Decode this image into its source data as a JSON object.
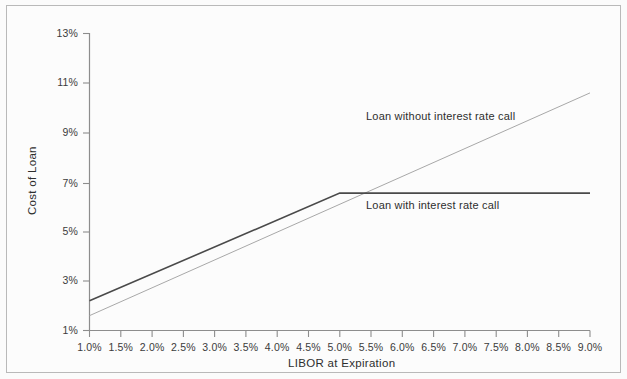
{
  "chart_data": {
    "type": "line",
    "title": "",
    "xlabel": "LIBOR at Expiration",
    "ylabel": "Cost of Loan",
    "xlim": [
      1.0,
      9.0
    ],
    "ylim": [
      1,
      13
    ],
    "grid": false,
    "legend": "annotations-inline",
    "xticks": [
      "1.0%",
      "1.5%",
      "2.0%",
      "2.5%",
      "3.0%",
      "3.5%",
      "4.0%",
      "4.5%",
      "5.0%",
      "5.5%",
      "6.0%",
      "6.5%",
      "7.0%",
      "7.5%",
      "8.0%",
      "8.5%",
      "9.0%"
    ],
    "xtick_values": [
      1.0,
      1.5,
      2.0,
      2.5,
      3.0,
      3.5,
      4.0,
      4.5,
      5.0,
      5.5,
      6.0,
      6.5,
      7.0,
      7.5,
      8.0,
      8.5,
      9.0
    ],
    "yticks": [
      "1%",
      "3%",
      "5%",
      "7%",
      "9%",
      "11%",
      "13%"
    ],
    "ytick_values": [
      1,
      3,
      5,
      7,
      9,
      11,
      13
    ],
    "series": [
      {
        "name": "Loan without interest rate call",
        "color": "#a8a8a8",
        "width": 1.0,
        "x": [
          1.0,
          9.0
        ],
        "values": [
          1.6,
          10.6
        ]
      },
      {
        "name": "Loan with interest rate call",
        "color": "#4a4a4a",
        "width": 1.6,
        "x": [
          1.0,
          5.0,
          9.0
        ],
        "values": [
          2.2,
          6.55,
          6.55
        ]
      }
    ],
    "annotations": [
      {
        "text": "Loan without interest rate call",
        "x_pct": 4.62,
        "y_pct": 9.6
      },
      {
        "text": "Loan with interest rate call",
        "x_pct": 5.25,
        "y_pct": 5.85
      }
    ]
  },
  "axes": {
    "ylabel": "Cost of Loan",
    "xlabel": "LIBOR at Expiration"
  }
}
